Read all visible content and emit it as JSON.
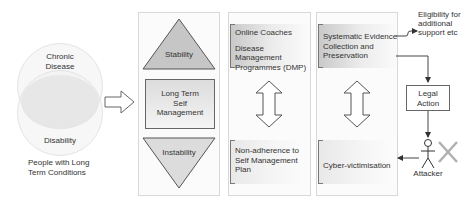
{
  "venn": {
    "top_label_line1": "Chronic",
    "top_label_line2": "Disease",
    "bottom_label": "Disability",
    "caption_line1": "People with Long",
    "caption_line2": "Term Conditions"
  },
  "panel1": {
    "top_triangle": "Stability",
    "middle_line1": "Long Term",
    "middle_line2": "Self",
    "middle_line3": "Management",
    "bottom_triangle": "Instability"
  },
  "panel2": {
    "top_line1": "Online Coaches",
    "top_line2": "Disease Management",
    "top_line3": "Programmes (DMP)",
    "bottom_line1": "Non-adherence to",
    "bottom_line2": "Self Management",
    "bottom_line3": "Plan"
  },
  "panel3": {
    "top_line1": "Systematic Evidence",
    "top_line2": "Collection and",
    "top_line3": "Preservation",
    "bottom_line1": "Cyber-victimisation"
  },
  "right": {
    "eligibility_line1": "Eligibility for",
    "eligibility_line2": "additional",
    "eligibility_line3": "support etc",
    "legal_line1": "Legal",
    "legal_line2": "Action",
    "attacker_label": "Attacker"
  },
  "colors": {
    "triangle_top": "#c6c6c6",
    "triangle_bottom": "#dcdcdc",
    "line": "#444444",
    "cross": "#b0b0b0"
  }
}
